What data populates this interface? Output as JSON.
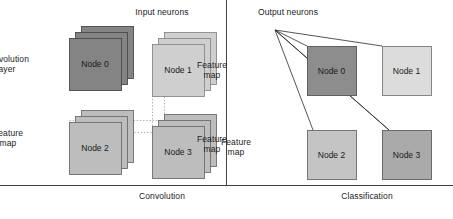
{
  "diagram": {
    "title_hidden": "",
    "sections": [
      {
        "id": "convolution",
        "caption": "Convolution",
        "caption_x": 162,
        "caption_y": 191
      },
      {
        "id": "classification",
        "caption": "Classification",
        "caption_x": 367,
        "caption_y": 191
      }
    ],
    "top_labels": [
      {
        "name": "input-neurons",
        "text": "Input neurons",
        "x": 162,
        "y": 7
      },
      {
        "name": "output-neurons",
        "text": "Output neurons",
        "x": 288,
        "y": 7
      }
    ],
    "side_labels": [
      {
        "name": "convolution-layer",
        "line1": "Convolution",
        "line2": "layer",
        "x": 6,
        "y": 54
      },
      {
        "name": "feature-map-top-right",
        "line1": "Feature",
        "line2": "map",
        "x": 212,
        "y": 60
      },
      {
        "name": "feature-map-bottom-left",
        "line1": "Feature",
        "line2": "map",
        "x": 8,
        "y": 128
      },
      {
        "name": "feature-map-bottom-right",
        "line1": "Feature",
        "line2": "map",
        "x": 212,
        "y": 134
      },
      {
        "name": "feature-map-classification",
        "line1": "Feature",
        "line2": "map",
        "x": 236,
        "y": 137
      }
    ],
    "conv_stacks": [
      {
        "name": "conv-stack-node0",
        "label": "Node 0",
        "x": 69,
        "y": 38,
        "w": 52,
        "h": 52,
        "fill": "#848484",
        "stroke": "#4a4a4a",
        "depth": 3,
        "dx": 6,
        "dy": -6,
        "text_color": "#1a1a1a"
      },
      {
        "name": "conv-stack-node1",
        "label": "Node 1",
        "x": 152,
        "y": 44,
        "w": 52,
        "h": 52,
        "fill": "#cfcfcf",
        "stroke": "#8a8a8a",
        "depth": 3,
        "dx": 6,
        "dy": -6,
        "text_color": "#1a1a1a"
      },
      {
        "name": "conv-stack-node2",
        "label": "Node 2",
        "x": 69,
        "y": 122,
        "w": 52,
        "h": 52,
        "fill": "#bdbdbd",
        "stroke": "#6e6e6e",
        "depth": 3,
        "dx": 6,
        "dy": -6,
        "text_color": "#1a1a1a"
      },
      {
        "name": "conv-stack-node3",
        "label": "Node 3",
        "x": 152,
        "y": 126,
        "w": 52,
        "h": 52,
        "fill": "#bdbdbd",
        "stroke": "#6e6e6e",
        "depth": 3,
        "dx": 6,
        "dy": -6,
        "text_color": "#1a1a1a"
      }
    ],
    "class_boxes": [
      {
        "name": "class-box-node0",
        "label": "Node 0",
        "x": 307,
        "y": 46,
        "w": 49,
        "h": 49,
        "fill": "#8d8d8d",
        "stroke": "#555555",
        "text_color": "#1a1a1a"
      },
      {
        "name": "class-box-node1",
        "label": "Node 1",
        "x": 382,
        "y": 46,
        "w": 49,
        "h": 49,
        "fill": "#dcdcdc",
        "stroke": "#7a7a7a",
        "text_color": "#1a1a1a"
      },
      {
        "name": "class-box-node2",
        "label": "Node 2",
        "x": 307,
        "y": 130,
        "w": 49,
        "h": 49,
        "fill": "#c4c4c4",
        "stroke": "#6a6a6a",
        "text_color": "#1a1a1a"
      },
      {
        "name": "class-box-node3",
        "label": "Node 3",
        "x": 382,
        "y": 130,
        "w": 49,
        "h": 49,
        "fill": "#aaaaaa",
        "stroke": "#5f5f5f",
        "text_color": "#1a1a1a"
      }
    ],
    "fan_origin": {
      "x": 275,
      "y": 30
    },
    "fan_targets": [
      {
        "name": "fan-line-to-node0",
        "x": 307,
        "y": 46
      },
      {
        "name": "fan-line-to-node1",
        "x": 382,
        "y": 46
      },
      {
        "name": "fan-line-to-node2",
        "x": 313,
        "y": 130
      },
      {
        "name": "fan-line-to-node3",
        "x": 389,
        "y": 130
      }
    ],
    "dotted_connectors": [
      {
        "name": "dotted-vertical-node1",
        "x1": 152,
        "y1": 44,
        "x2": 152,
        "y2": 132
      },
      {
        "name": "dotted-horizontal-node3",
        "x1": 121,
        "y1": 132,
        "x2": 180,
        "y2": 132
      },
      {
        "name": "dotted-vertical-node1-right",
        "x1": 164,
        "y1": 32,
        "x2": 164,
        "y2": 120
      },
      {
        "name": "dotted-horizontal-node2",
        "x1": 69,
        "y1": 120,
        "x2": 164,
        "y2": 120
      }
    ],
    "divider": {
      "name": "section-divider",
      "x": 226,
      "y1": 0,
      "y2": 185
    },
    "baseline": {
      "name": "baseline-rule",
      "y": 185,
      "x1": 0,
      "x2": 453
    },
    "colors": {
      "ink": "#1b1b1b",
      "line": "#2a2a2a",
      "dotted": "#999999",
      "background": "#ffffff"
    }
  }
}
